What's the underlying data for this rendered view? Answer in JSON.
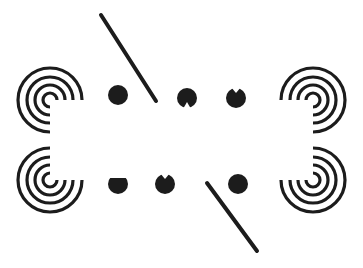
{
  "figure": {
    "width": 363,
    "height": 268,
    "background": "#ffffff",
    "ink": "#1c1c1c",
    "spirals": [
      {
        "name": "spiral-top-left",
        "cx": 50,
        "cy": 100,
        "open": "bottom-right"
      },
      {
        "name": "spiral-bottom-left",
        "cx": 50,
        "cy": 180,
        "open": "top-right"
      },
      {
        "name": "spiral-top-right",
        "cx": 313,
        "cy": 100,
        "open": "bottom-left"
      },
      {
        "name": "spiral-bottom-right",
        "cx": 313,
        "cy": 180,
        "open": "top-left"
      }
    ],
    "lines": [
      {
        "name": "diagonal-line-top",
        "x1": 101,
        "y1": 15,
        "x2": 156,
        "y2": 101
      },
      {
        "name": "diagonal-line-bottom",
        "x1": 207,
        "y1": 183,
        "x2": 257,
        "y2": 251
      }
    ],
    "dots": [
      {
        "name": "dot-top-1",
        "cx": 118,
        "cy": 95,
        "notch": "none"
      },
      {
        "name": "dot-top-2",
        "cx": 187,
        "cy": 98,
        "notch": "bottom"
      },
      {
        "name": "dot-top-3",
        "cx": 236,
        "cy": 98,
        "notch": "top"
      },
      {
        "name": "dot-bottom-1",
        "cx": 118,
        "cy": 184,
        "notch": "top-flat"
      },
      {
        "name": "dot-bottom-2",
        "cx": 165,
        "cy": 184,
        "notch": "top"
      },
      {
        "name": "dot-bottom-3",
        "cx": 238,
        "cy": 184,
        "notch": "none"
      }
    ]
  }
}
